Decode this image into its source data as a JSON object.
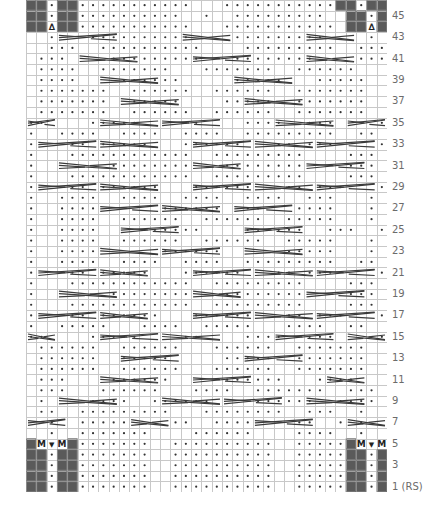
{
  "chart_title": "",
  "grid": {
    "columns": 35,
    "rows": 46,
    "colors": {
      "gridline": "#c8c8c8",
      "no_stitch": "#5a5a5a",
      "purl_dot": "#333333",
      "cable_line": "#3a3a3a",
      "label": "#6b6b6b"
    }
  },
  "legend_symbols": {
    ".": "purl",
    " ": "knit",
    "#": "no stitch",
    "M": "make one",
    "V": "knit into front and back",
    "A": "centered double decrease"
  },
  "row_labels": [
    {
      "row": 1,
      "text": "1 (RS)"
    },
    {
      "row": 3,
      "text": "3"
    },
    {
      "row": 5,
      "text": "5"
    },
    {
      "row": 7,
      "text": "7"
    },
    {
      "row": 9,
      "text": "9"
    },
    {
      "row": 11,
      "text": "11"
    },
    {
      "row": 13,
      "text": "13"
    },
    {
      "row": 15,
      "text": "15"
    },
    {
      "row": 17,
      "text": "17"
    },
    {
      "row": 19,
      "text": "19"
    },
    {
      "row": 21,
      "text": "21"
    },
    {
      "row": 23,
      "text": "23"
    },
    {
      "row": 25,
      "text": "25"
    },
    {
      "row": 27,
      "text": "27"
    },
    {
      "row": 29,
      "text": "29"
    },
    {
      "row": 31,
      "text": "31"
    },
    {
      "row": 33,
      "text": "33"
    },
    {
      "row": 35,
      "text": "35"
    },
    {
      "row": 37,
      "text": "37"
    },
    {
      "row": 39,
      "text": "39"
    },
    {
      "row": 41,
      "text": "41"
    },
    {
      "row": 43,
      "text": "43"
    },
    {
      "row": 45,
      "text": "45"
    }
  ],
  "rows": {
    "1": "##.##.......  ..........  .....##.##",
    "2": "##.##.......  ..........  .....##.##",
    "3": "##.##.......  ..........  .....##.##",
    "4": "##.##.......  ..........  .....##.##",
    "5": "#MVM#.......  ..........  .....#MVM#",
    "6": "  .  .......    ......    ....  .   ",
    "7": "  .  .....    ..  ....    ..  . .   ",
    "8": " ..  .........   ........  ...  .   ",
    "9": " .    ....  ......    ......  ....  ",
    "10": " ...   ......   ....  .......  ...  ",
    "11": " ...    ......     ......   ....    ",
    "12": " ......  ......   ......  .......   ",
    "13": " ......  .....     .....  .......   ",
    "14": " ......  ......   ......  .......   ",
    "15": "..    .....    ..    ....  ...    . ",
    "16": ".  .....   ....  .....   ....  ..   ",
    "17": ".   .. ......   ......   .. ...   . ",
    "18": ".   ............  .........    ...  ",
    "19": ".       ........   ........    ...  ",
    "20": ".   ............  .........    ...  ",
    "21": ".   .. .....   ......   .. ...    . ",
    "22": ".  ....  ....  ....  .........  ..  ",
    "23": ".  ....      ......      .....   .  ",
    "24": ".  ....  ......  ......  .....   .  ",
    "25": ".  ....    ......    ......  ...  . ",
    "26": ".  ....  ......  ......  .....   .  ",
    "27": ".  ....      ......  ..   ....   .  ",
    "28": ".  ....  ....  ....  ....  ...   .  ",
    "29": ".   .. ......   ......   .. ...   . ",
    "30": ".   ............  .........    ...  ",
    "31": ".       ........   ........    ...  ",
    "32": ".   ............  .........    ...  ",
    "33": ".   .. .....   ......   .. ...    . ",
    "34": ".  ....  ....  ....  .........  ..  ",
    "35": "..    .....    ..    ....  ...    . ",
    "36": " .......  ......  ......  .......   ",
    "37": " .......  .....    .....  .......   ",
    "38": " .......  ......  ......  .......   ",
    "39": " ....    ......     .....   .....   ",
    "40": " ....  .......   .......  ......    ",
    "41": " ...    .........   ........    ... ",
    "42": "  ...  ..........    .........  ... ",
    "43": "  .   ..........    .........    .   ",
    "44": "##A##...........   ........... ##A##",
    "45": "##.##..........  .  .........  ##.##",
    "46": "##.##...........   ...........##.##"
  },
  "cables": [
    {
      "row": 7,
      "from": 0,
      "to": 4,
      "type": "right"
    },
    {
      "row": 7,
      "from": 10,
      "to": 14,
      "type": "left"
    },
    {
      "row": 7,
      "from": 22,
      "to": 28,
      "type": "right"
    },
    {
      "row": 7,
      "from": 31,
      "to": 35,
      "type": "left"
    },
    {
      "row": 9,
      "from": 3,
      "to": 9,
      "type": "left"
    },
    {
      "row": 9,
      "from": 13,
      "to": 19,
      "type": "left"
    },
    {
      "row": 9,
      "from": 19,
      "to": 25,
      "type": "right"
    },
    {
      "row": 9,
      "from": 27,
      "to": 33,
      "type": "left"
    },
    {
      "row": 11,
      "from": 7,
      "to": 13,
      "type": "left"
    },
    {
      "row": 11,
      "from": 16,
      "to": 22,
      "type": "right"
    },
    {
      "row": 11,
      "from": 29,
      "to": 33,
      "type": "left"
    },
    {
      "row": 13,
      "from": 9,
      "to": 15,
      "type": "right"
    },
    {
      "row": 13,
      "from": 21,
      "to": 27,
      "type": "right"
    },
    {
      "row": 15,
      "from": 0,
      "to": 3,
      "type": "left"
    },
    {
      "row": 15,
      "from": 7,
      "to": 13,
      "type": "right"
    },
    {
      "row": 15,
      "from": 13,
      "to": 19,
      "type": "left"
    },
    {
      "row": 15,
      "from": 24,
      "to": 30,
      "type": "right"
    },
    {
      "row": 15,
      "from": 31,
      "to": 35,
      "type": "left"
    },
    {
      "row": 17,
      "from": 1,
      "to": 7,
      "type": "right"
    },
    {
      "row": 17,
      "from": 7,
      "to": 12,
      "type": "left"
    },
    {
      "row": 17,
      "from": 16,
      "to": 22,
      "type": "right"
    },
    {
      "row": 17,
      "from": 22,
      "to": 28,
      "type": "left"
    },
    {
      "row": 17,
      "from": 28,
      "to": 34,
      "type": "right"
    },
    {
      "row": 19,
      "from": 3,
      "to": 9,
      "type": "left"
    },
    {
      "row": 19,
      "from": 16,
      "to": 21,
      "type": "left"
    },
    {
      "row": 19,
      "from": 27,
      "to": 33,
      "type": "right"
    },
    {
      "row": 21,
      "from": 1,
      "to": 7,
      "type": "right"
    },
    {
      "row": 21,
      "from": 7,
      "to": 12,
      "type": "left"
    },
    {
      "row": 21,
      "from": 16,
      "to": 22,
      "type": "right"
    },
    {
      "row": 21,
      "from": 22,
      "to": 28,
      "type": "left"
    },
    {
      "row": 21,
      "from": 28,
      "to": 34,
      "type": "right"
    },
    {
      "row": 23,
      "from": 7,
      "to": 13,
      "type": "left"
    },
    {
      "row": 23,
      "from": 13,
      "to": 19,
      "type": "right"
    },
    {
      "row": 23,
      "from": 21,
      "to": 27,
      "type": "left"
    },
    {
      "row": 25,
      "from": 9,
      "to": 15,
      "type": "right"
    },
    {
      "row": 25,
      "from": 21,
      "to": 27,
      "type": "right"
    },
    {
      "row": 27,
      "from": 7,
      "to": 13,
      "type": "right"
    },
    {
      "row": 27,
      "from": 13,
      "to": 19,
      "type": "left"
    },
    {
      "row": 27,
      "from": 20,
      "to": 26,
      "type": "right"
    },
    {
      "row": 29,
      "from": 1,
      "to": 7,
      "type": "right"
    },
    {
      "row": 29,
      "from": 7,
      "to": 13,
      "type": "left"
    },
    {
      "row": 29,
      "from": 16,
      "to": 22,
      "type": "right"
    },
    {
      "row": 29,
      "from": 22,
      "to": 28,
      "type": "left"
    },
    {
      "row": 29,
      "from": 28,
      "to": 34,
      "type": "right"
    },
    {
      "row": 31,
      "from": 3,
      "to": 9,
      "type": "left"
    },
    {
      "row": 31,
      "from": 16,
      "to": 21,
      "type": "left"
    },
    {
      "row": 31,
      "from": 27,
      "to": 33,
      "type": "right"
    },
    {
      "row": 33,
      "from": 1,
      "to": 7,
      "type": "right"
    },
    {
      "row": 33,
      "from": 7,
      "to": 13,
      "type": "left"
    },
    {
      "row": 33,
      "from": 16,
      "to": 22,
      "type": "right"
    },
    {
      "row": 33,
      "from": 22,
      "to": 28,
      "type": "left"
    },
    {
      "row": 33,
      "from": 28,
      "to": 34,
      "type": "right"
    },
    {
      "row": 35,
      "from": 0,
      "to": 3,
      "type": "right"
    },
    {
      "row": 35,
      "from": 7,
      "to": 13,
      "type": "left"
    },
    {
      "row": 35,
      "from": 13,
      "to": 19,
      "type": "right"
    },
    {
      "row": 35,
      "from": 24,
      "to": 30,
      "type": "left"
    },
    {
      "row": 35,
      "from": 31,
      "to": 35,
      "type": "right"
    },
    {
      "row": 37,
      "from": 9,
      "to": 15,
      "type": "left"
    },
    {
      "row": 37,
      "from": 21,
      "to": 27,
      "type": "left"
    },
    {
      "row": 39,
      "from": 7,
      "to": 13,
      "type": "left"
    },
    {
      "row": 39,
      "from": 20,
      "to": 26,
      "type": "left"
    },
    {
      "row": 41,
      "from": 5,
      "to": 11,
      "type": "left"
    },
    {
      "row": 41,
      "from": 16,
      "to": 22,
      "type": "right"
    },
    {
      "row": 41,
      "from": 27,
      "to": 32,
      "type": "left"
    },
    {
      "row": 43,
      "from": 3,
      "to": 9,
      "type": "right"
    },
    {
      "row": 43,
      "from": 15,
      "to": 20,
      "type": "left"
    },
    {
      "row": 43,
      "from": 27,
      "to": 32,
      "type": "left"
    }
  ]
}
